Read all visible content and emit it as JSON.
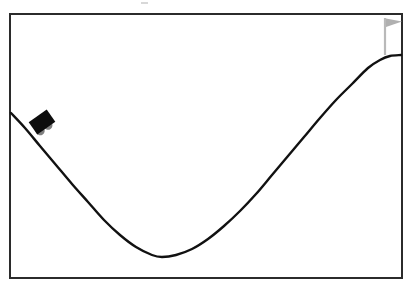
{
  "scene": {
    "name": "Mountain Car",
    "environment_label": "mountain-car",
    "background_color": "#ffffff",
    "frame": {
      "color": "#2b2b2b",
      "stroke_width": 2.5,
      "x": 9,
      "y": 13,
      "width": 394,
      "height": 266
    }
  },
  "chart_data": {
    "type": "line",
    "title": "",
    "subtitle": "",
    "xlabel": "",
    "ylabel": "",
    "xlim": [
      11,
      401
    ],
    "ylim": [
      15,
      277
    ],
    "grid": false,
    "legend": null,
    "tick_labels": {
      "x": [],
      "y": []
    },
    "series": [
      {
        "name": "hill-terrain",
        "stroke": "#111111",
        "stroke_width": 2.4,
        "x": [
          11,
          25,
          40,
          56,
          72,
          88,
          104,
          120,
          136,
          152,
          162,
          176,
          192,
          208,
          224,
          240,
          256,
          272,
          288,
          304,
          320,
          336,
          352,
          368,
          380,
          390,
          401
        ],
        "y": [
          113,
          128,
          146,
          165,
          184,
          202,
          220,
          235,
          247,
          255,
          257,
          255,
          249,
          239,
          226,
          211,
          194,
          175,
          156,
          137,
          118,
          100,
          84,
          68,
          60,
          56,
          55
        ]
      }
    ],
    "annotations": [
      {
        "name": "car",
        "type": "agent-marker",
        "x": 42,
        "y": 122,
        "rotation_deg": -35,
        "body_color": "#0d0d0d",
        "wheel_color": "#808080"
      },
      {
        "name": "goal-flag",
        "type": "goal-marker",
        "x": 385,
        "y": 55,
        "pole_top_y": 18,
        "pole_color": "#b9b9b9",
        "pennant_color": "#b0b0b0"
      }
    ]
  },
  "objects": {
    "hill": {
      "label": "hill-terrain-curve"
    },
    "car": {
      "label": "mountain-car-agent",
      "body_color": "#0d0d0d",
      "wheel_color": "#808080",
      "rotation_deg": -35,
      "position_x": 42,
      "position_y": 122
    },
    "flag": {
      "label": "goal-flag",
      "pole_color": "#b9b9b9",
      "pennant_color": "#b0b0b0",
      "position_x": 385,
      "position_y": 55
    }
  }
}
